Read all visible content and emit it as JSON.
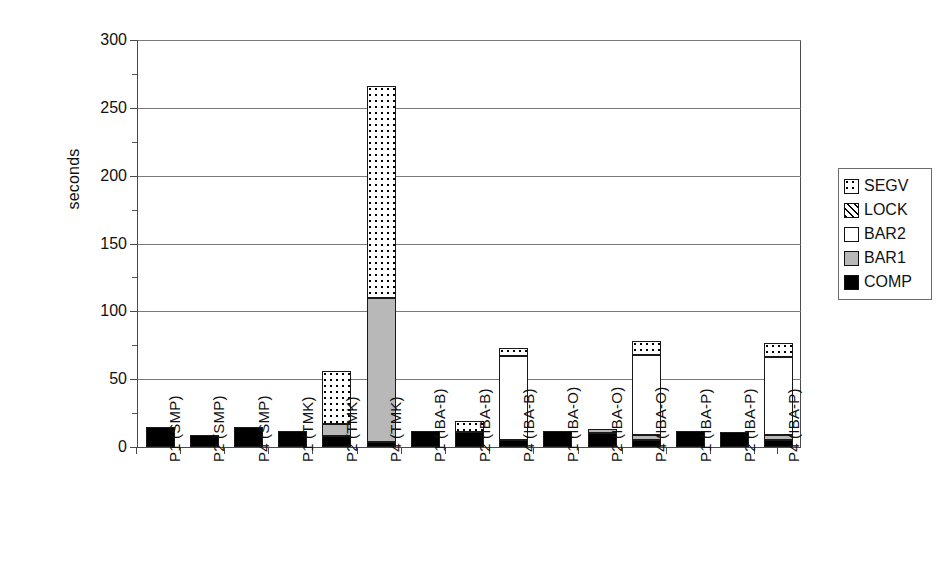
{
  "chart_data": {
    "type": "bar",
    "title": "",
    "subtitle": "",
    "xlabel": "",
    "ylabel": "seconds",
    "ylim": [
      0,
      300
    ],
    "ytick_values": [
      0,
      50,
      100,
      150,
      200,
      250,
      300
    ],
    "ytick_labels": [
      "0",
      "50",
      "100",
      "150",
      "200",
      "250",
      "300"
    ],
    "grid": true,
    "stacked": true,
    "legend_position": "right",
    "legend_entries": [
      "SEGV",
      "LOCK",
      "BAR2",
      "BAR1",
      "COMP"
    ],
    "series_order_bottom_to_top": [
      "COMP",
      "BAR1",
      "BAR2",
      "LOCK",
      "SEGV"
    ],
    "colors": {
      "COMP": "#000000",
      "BAR1": "#b8b8b8",
      "BAR2": "#ffffff",
      "LOCK": "#ffffff",
      "SEGV": "#ffffff"
    },
    "patterns": {
      "COMP": "solid-black",
      "BAR1": "solid-gray",
      "BAR2": "empty-white",
      "LOCK": "diagonal-hatch",
      "SEGV": "dotted-stipple"
    },
    "categories": [
      "P1 (SMP)",
      "P2 (SMP)",
      "P4 (SMP)",
      "P1 (TMK)",
      "P2 (TMK)",
      "P4 (TMK)",
      "P1 (IBA-B)",
      "P2 (IBA-B)",
      "P4 (IBA-B)",
      "P1 (IBA-O)",
      "P2 (IBA-O)",
      "P4 (IBA-O)",
      "P1 (IBA-P)",
      "P2 (IBA-P)",
      "P4 (IBA-P)"
    ],
    "series": [
      {
        "name": "COMP",
        "values": [
          15,
          9,
          15,
          12,
          8,
          4,
          12,
          11,
          5,
          12,
          10,
          5,
          12,
          11,
          5
        ]
      },
      {
        "name": "BAR1",
        "values": [
          0,
          0,
          0,
          0,
          9,
          106,
          0,
          0,
          0,
          0,
          3,
          4,
          0,
          0,
          4
        ]
      },
      {
        "name": "BAR2",
        "values": [
          0,
          0,
          0,
          0,
          0,
          0,
          0,
          0,
          62,
          0,
          0,
          59,
          0,
          0,
          57
        ]
      },
      {
        "name": "LOCK",
        "values": [
          0,
          0,
          0,
          0,
          0,
          0,
          0,
          0,
          0,
          0,
          0,
          0,
          0,
          0,
          0
        ]
      },
      {
        "name": "SEGV",
        "values": [
          0,
          0,
          0,
          0,
          39,
          156,
          0,
          8,
          6,
          0,
          0,
          10,
          0,
          0,
          11
        ]
      }
    ],
    "totals": [
      15,
      9,
      15,
      12,
      56,
      266,
      12,
      19,
      73,
      12,
      13,
      78,
      12,
      11,
      77
    ]
  }
}
